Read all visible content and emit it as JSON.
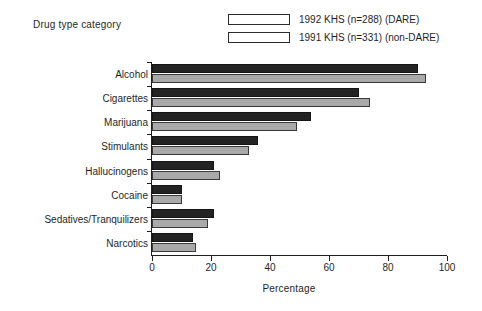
{
  "chart_data": {
    "type": "bar",
    "orientation": "horizontal",
    "title": "",
    "category_axis_title": "Drug type category",
    "xlabel": "Percentage",
    "ylabel": "",
    "xlim": [
      0,
      100
    ],
    "xticks": [
      0,
      20,
      40,
      60,
      80,
      100
    ],
    "grid": false,
    "legend_position": "top-right",
    "categories": [
      "Alcohol",
      "Cigarettes",
      "Marijuana",
      "Stimulants",
      "Hallucinogens",
      "Cocaine",
      "Sedatives/Tranquilizers",
      "Narcotics"
    ],
    "series": [
      {
        "name": "1992 KHS (n=288) (DARE)",
        "color": "#232323",
        "values": [
          90,
          70,
          54,
          36,
          21,
          10,
          21,
          14
        ]
      },
      {
        "name": "1991 KHS (n=331) (non-DARE)",
        "color": "#a9a9a9",
        "values": [
          93,
          74,
          49,
          33,
          23,
          10,
          19,
          15
        ]
      }
    ]
  }
}
